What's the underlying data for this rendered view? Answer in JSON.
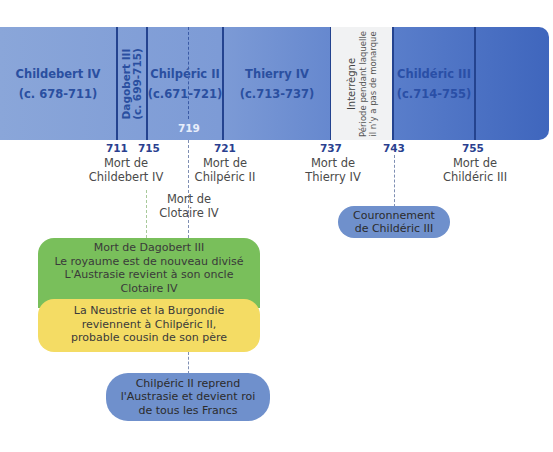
{
  "timeline": {
    "reigns": [
      {
        "name": "Childebert IV",
        "dates": "(c. 678-711)"
      },
      {
        "name": "Dagobert III",
        "dates": "(c. 699-715)"
      },
      {
        "name": "Chilpéric II",
        "dates": "(c.671-721)"
      },
      {
        "name": "Thierry IV",
        "dates": "(c.713-737)"
      },
      {
        "name": "Childéric III",
        "dates": "(c.714-755)"
      }
    ],
    "interregnum": {
      "title": "Interrègne",
      "line1": "Période pendant laquelle",
      "line2": "il n'y a pas de monarque"
    },
    "inner_year": "719",
    "years": [
      "711",
      "715",
      "721",
      "737",
      "743",
      "755"
    ]
  },
  "events": {
    "e711": [
      "Mort de",
      "Childebert IV"
    ],
    "e721": [
      "Mort de",
      "Chilpéric II"
    ],
    "e719": [
      "Mort de",
      "Clotaire IV"
    ],
    "e737": [
      "Mort de",
      "Thierry IV"
    ],
    "e755": [
      "Mort de",
      "Childéric III"
    ]
  },
  "boxes": {
    "green": [
      "Mort de Dagobert III",
      "Le royaume est de nouveau divisé",
      "L'Austrasie revient à son oncle",
      "Clotaire IV"
    ],
    "yellow": [
      "La Neustrie et la Burgondie",
      "reviennent à Chilpéric II,",
      "probable cousin de son père"
    ],
    "coronation": [
      "Couronnement",
      "de Childéric III"
    ],
    "chilperic": [
      "Chilpéric II reprend",
      "l'Austrasie et devient roi",
      "de tous les Francs"
    ]
  },
  "colors": {
    "band_light": "#8aa6d9",
    "band_dark": "#3f66bd",
    "divider": "#24438f",
    "label_text": "#2a4fa0",
    "green_box": "#79bf5b",
    "yellow_box": "#f4dc64",
    "blue_pill": "#6f90cc"
  }
}
